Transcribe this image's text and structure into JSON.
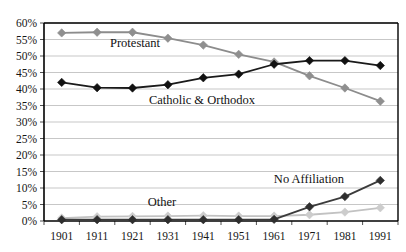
{
  "chart_data": {
    "type": "line",
    "title": "",
    "subtitle": "",
    "xlabel": "",
    "ylabel": "",
    "categories": [
      "1901",
      "1911",
      "1921",
      "1931",
      "1941",
      "1951",
      "1961",
      "1971",
      "1981",
      "1991"
    ],
    "x": [
      1901,
      1911,
      1921,
      1931,
      1941,
      1951,
      1961,
      1971,
      1981,
      1991
    ],
    "ylim": [
      0,
      60
    ],
    "ytick_labels": [
      "0%",
      "5%",
      "10%",
      "15%",
      "20%",
      "25%",
      "30%",
      "35%",
      "40%",
      "45%",
      "50%",
      "55%",
      "60%"
    ],
    "ytick_values": [
      0,
      5,
      10,
      15,
      20,
      25,
      30,
      35,
      40,
      45,
      50,
      55,
      60
    ],
    "ytick_suffix": "%",
    "ytick_step": 5,
    "grid": true,
    "grid_axis": "y",
    "legend": "none",
    "legend_position": "inline-annotations",
    "marker": "diamond",
    "series": [
      {
        "name": "Protestant",
        "color": "#8c8c8c",
        "marker_color": "#8f8f8f",
        "values": [
          57.0,
          57.2,
          57.2,
          55.4,
          53.3,
          50.5,
          48.2,
          44.0,
          40.3,
          36.3
        ]
      },
      {
        "name": "Catholic & Orthodox",
        "color": "#1a1a1a",
        "marker_color": "#111111",
        "values": [
          42.0,
          40.4,
          40.3,
          41.3,
          43.4,
          44.5,
          47.5,
          48.6,
          48.6,
          47.1
        ]
      },
      {
        "name": "No Affiliation",
        "color": "#3b3b3b",
        "marker_color": "#2e2e2e",
        "values": [
          0.4,
          0.4,
          0.4,
          0.4,
          0.4,
          0.4,
          0.5,
          4.3,
          7.4,
          12.3
        ]
      },
      {
        "name": "Other",
        "color": "#c2c2c2",
        "marker_color": "#cccccc",
        "values": [
          0.9,
          1.3,
          1.4,
          1.5,
          1.6,
          1.5,
          1.5,
          1.9,
          2.7,
          4.0
        ]
      }
    ],
    "annotations": [
      {
        "text": "Protestant",
        "x_px": 135,
        "y_px": 47
      },
      {
        "text": "Catholic & Orthodox",
        "x_px": 202,
        "y_px": 104
      },
      {
        "text": "No Affiliation",
        "x_px": 309,
        "y_px": 183
      },
      {
        "text": "Other",
        "x_px": 162,
        "y_px": 206
      }
    ]
  },
  "colors": {
    "background": "#ffffff",
    "grid": "#b9b9b9",
    "axis": "#000000",
    "protestant": "#8c8c8c",
    "catholic": "#1a1a1a",
    "no_affiliation": "#3b3b3b",
    "other": "#c2c2c2"
  }
}
